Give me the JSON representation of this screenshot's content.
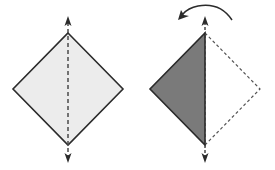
{
  "diagram": {
    "type": "origami-fold-instruction",
    "title": "Valley fold along vertical diagonal",
    "colors": {
      "outline": "#2b2b2b",
      "paper_light": "#ececec",
      "paper_dark": "#7a7a7a",
      "dashed_line": "#4a4a4a",
      "background": "#ffffff"
    },
    "steps": [
      {
        "label": "Step 1: square diamond with vertical dashed fold line",
        "shape": "diamond",
        "center_x": 68,
        "top": 33,
        "bottom": 145,
        "left": 13,
        "right": 123,
        "mid_y": 89,
        "fold_line": "vertical-dashed",
        "arrows": [
          "up-arrow-top",
          "down-arrow-bottom"
        ]
      },
      {
        "label": "Step 2: right half folded over to the left",
        "shape": "half-diamond-folded",
        "center_x": 205,
        "top": 33,
        "bottom": 145,
        "left": 150,
        "right": 260,
        "mid_y": 89,
        "folded_side": "left",
        "ghost_side": "right-dashed",
        "arrows": [
          "curved-fold-arrow-leftward",
          "up-arrow-top",
          "down-arrow-bottom"
        ]
      }
    ]
  }
}
